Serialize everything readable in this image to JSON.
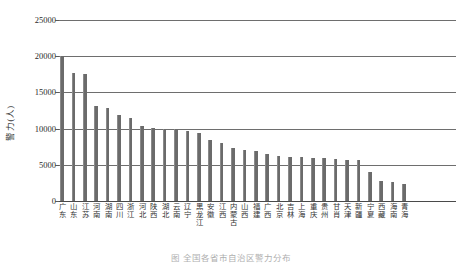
{
  "chart_data": {
    "type": "bar",
    "title": "",
    "subtitle": "",
    "xlabel": "",
    "ylabel": "警力(人)",
    "ylim": [
      0,
      25000
    ],
    "yticks": [
      0,
      5000,
      10000,
      15000,
      20000,
      25000
    ],
    "ytick_labels": [
      "0",
      "5000",
      "10000",
      "15000",
      "20000",
      "25000"
    ],
    "grid": true,
    "legend": null,
    "bar_color": "#6b6b6b",
    "categories": [
      "广东",
      "山东",
      "江苏",
      "河南",
      "湖南",
      "四川",
      "浙江",
      "河北",
      "陕西",
      "湖北",
      "云南",
      "辽宁",
      "黑龙江",
      "安徽",
      "江西",
      "内蒙古",
      "山西",
      "福建",
      "广西",
      "北京",
      "吉林",
      "上海",
      "重庆",
      "贵州",
      "甘肖",
      "天津",
      "新疆",
      "宁夏",
      "西藏",
      "海南",
      "青海"
    ],
    "values": [
      20050,
      17700,
      17600,
      13100,
      12900,
      11900,
      11450,
      10400,
      10050,
      10000,
      9900,
      9700,
      9400,
      8400,
      8000,
      7300,
      7000,
      6900,
      6500,
      6150,
      6100,
      6050,
      6000,
      5900,
      5800,
      5700,
      5600,
      4050,
      2800,
      2600,
      2400
    ]
  },
  "figure": {
    "y_axis_title": "警力(人)",
    "caption": "图  全国各省市自治区警力分布"
  }
}
